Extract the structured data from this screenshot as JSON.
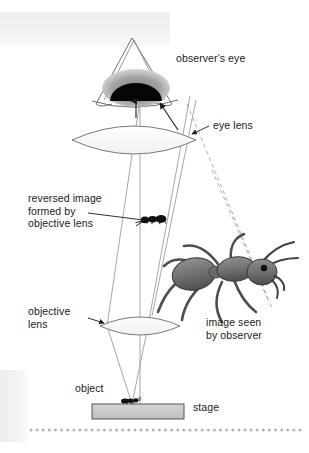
{
  "labels": {
    "observer_eye": "observer's eye",
    "eye_lens": "eye lens",
    "reversed_image_line1": "reversed image",
    "reversed_image_line2": "formed by",
    "reversed_image_line3": "objective lens",
    "objective_lens_line1": "objective",
    "objective_lens_line2": "lens",
    "image_seen_line1": "image seen",
    "image_seen_line2": "by observer",
    "object": "object",
    "stage": "stage"
  },
  "elements": {
    "eye": "observer-eye-drawing",
    "eye_lens": "eye-lens-biconvex",
    "objective_lens": "objective-lens-biconvex",
    "small_ant_image": "reversed-ant-image",
    "large_ant_image": "magnified-ant-image",
    "object_ant": "ant-specimen-on-stage",
    "stage_bar": "microscope-stage",
    "dotted_rule": "decorative-dotted-rule"
  },
  "colors": {
    "ink": "#1a1a1a",
    "ray_line": "#8a8a8a",
    "dash_line": "#9a9a9a",
    "stage_fill": "#c9c9c9",
    "stage_stroke": "#555555",
    "pupil": "#000000",
    "iris": "#9b9b9b",
    "ant_body": "#6d6d6d",
    "ant_outline": "#3a3a3a",
    "band": "#f0f0f0",
    "dot": "#b4b4b4",
    "background": "#ffffff"
  },
  "counts": {
    "dotted_rule_dots": 45
  }
}
